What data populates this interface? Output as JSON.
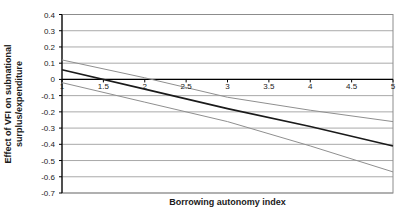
{
  "chart_data": {
    "type": "line",
    "title": "",
    "xlabel": "Borrowing autonomy index",
    "ylabel": "Effect of VFI on subnational surplus/expenditure",
    "ylabel_lines": [
      "Effect of VFI on subnational",
      "surplus/expenditure"
    ],
    "x": [
      1,
      2,
      3,
      4,
      5
    ],
    "series": [
      {
        "name": "marginal-effect",
        "values": [
          0.06,
          -0.06,
          -0.18,
          -0.29,
          -0.41
        ],
        "color": "#1a1a1a",
        "width": 1.6
      },
      {
        "name": "upper-confidence-bound",
        "values": [
          0.12,
          0.01,
          -0.11,
          -0.19,
          -0.26
        ],
        "color": "#8f8f8f",
        "width": 1
      },
      {
        "name": "lower-confidence-bound",
        "values": [
          -0.02,
          -0.14,
          -0.26,
          -0.41,
          -0.57
        ],
        "color": "#8f8f8f",
        "width": 1
      }
    ],
    "xlim": [
      1,
      5
    ],
    "ylim": [
      -0.7,
      0.4
    ],
    "x_ticks": [
      1,
      1.5,
      2,
      2.5,
      3,
      3.5,
      4,
      4.5,
      5
    ],
    "x_tick_labels": [
      "1",
      "1.5",
      "2",
      "2.5",
      "3",
      "3.5",
      "4",
      "4.5",
      "5"
    ],
    "y_ticks": [
      0.4,
      0.3,
      0.2,
      0.1,
      0,
      -0.1,
      -0.2,
      -0.3,
      -0.4,
      -0.5,
      -0.6,
      -0.7
    ],
    "y_tick_labels": [
      "0.4",
      "0.3",
      "0.2",
      "0.1",
      "0",
      "-0.1",
      "-0.2",
      "-0.3",
      "-0.4",
      "-0.5",
      "-0.6",
      "-0.7"
    ],
    "grid": true,
    "legend": "none",
    "colors": {
      "grid": "#a9a9a9",
      "axis": "#000000",
      "border": "#8c8c8c",
      "background": "#ffffff"
    }
  }
}
